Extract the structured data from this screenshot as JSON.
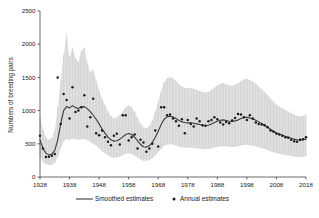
{
  "chart_data": {
    "type": "line",
    "title": "",
    "xlabel": "",
    "ylabel": "Numbers of breeding pairs",
    "xlim": [
      1928,
      2018
    ],
    "ylim": [
      0,
      2500
    ],
    "xticks": [
      1928,
      1938,
      1948,
      1958,
      1968,
      1978,
      1988,
      1998,
      2008,
      2018
    ],
    "yticks": [
      0,
      500,
      1000,
      1500,
      2000,
      2500
    ],
    "grid": false,
    "legend_position": "bottom",
    "legend": [
      {
        "label": "Smoothed estimates",
        "marker": "line",
        "color": "#3a3a3a"
      },
      {
        "label": "Annual estimates",
        "marker": "point",
        "color": "#1c1c1c"
      }
    ],
    "band_color": "#c9c9c9",
    "x": [
      1928,
      1929,
      1930,
      1931,
      1932,
      1933,
      1934,
      1935,
      1936,
      1937,
      1938,
      1939,
      1940,
      1941,
      1942,
      1943,
      1944,
      1945,
      1946,
      1947,
      1948,
      1949,
      1950,
      1951,
      1952,
      1953,
      1954,
      1955,
      1956,
      1957,
      1958,
      1959,
      1960,
      1961,
      1962,
      1963,
      1964,
      1965,
      1966,
      1967,
      1968,
      1969,
      1970,
      1971,
      1972,
      1973,
      1974,
      1975,
      1976,
      1977,
      1978,
      1979,
      1980,
      1981,
      1982,
      1983,
      1984,
      1985,
      1986,
      1987,
      1988,
      1989,
      1990,
      1991,
      1992,
      1993,
      1994,
      1995,
      1996,
      1997,
      1998,
      1999,
      2000,
      2001,
      2002,
      2003,
      2004,
      2005,
      2006,
      2007,
      2008,
      2009,
      2010,
      2011,
      2012,
      2013,
      2014,
      2015,
      2016,
      2017,
      2018
    ],
    "series": [
      {
        "name": "Smoothed estimates",
        "type": "line",
        "values": [
          560,
          430,
          360,
          330,
          345,
          400,
          560,
          800,
          1000,
          1060,
          1040,
          1075,
          1045,
          1035,
          1055,
          1060,
          1030,
          985,
          930,
          870,
          800,
          720,
          660,
          600,
          560,
          540,
          545,
          570,
          605,
          640,
          655,
          640,
          600,
          545,
          490,
          455,
          450,
          470,
          520,
          600,
          690,
          790,
          870,
          905,
          915,
          905,
          880,
          850,
          830,
          820,
          815,
          815,
          810,
          800,
          790,
          780,
          775,
          780,
          800,
          820,
          840,
          855,
          860,
          850,
          840,
          835,
          845,
          860,
          880,
          895,
          900,
          890,
          875,
          855,
          830,
          805,
          780,
          750,
          720,
          690,
          665,
          645,
          630,
          615,
          600,
          585,
          570,
          560,
          555,
          560,
          570
        ]
      },
      {
        "name": "Annual estimates",
        "type": "scatter",
        "values": [
          620,
          430,
          300,
          305,
          320,
          345,
          1500,
          800,
          1250,
          1160,
          880,
          1350,
          980,
          1000,
          1050,
          1230,
          760,
          900,
          1180,
          660,
          630,
          700,
          600,
          530,
          480,
          620,
          650,
          490,
          930,
          930,
          550,
          600,
          640,
          430,
          560,
          520,
          380,
          430,
          500,
          700,
          460,
          1050,
          1050,
          930,
          940,
          880,
          840,
          770,
          870,
          660,
          860,
          800,
          760,
          880,
          840,
          780,
          770,
          840,
          860,
          900,
          870,
          820,
          790,
          830,
          810,
          850,
          890,
          950,
          940,
          900,
          860,
          930,
          880,
          820,
          800,
          790,
          780,
          750,
          700,
          680,
          650,
          640,
          620,
          600,
          590,
          560,
          540,
          530,
          560,
          570,
          600
        ]
      }
    ],
    "ci_lower": [
      300,
      230,
      195,
      180,
      185,
      215,
      300,
      430,
      540,
      570,
      560,
      580,
      565,
      560,
      570,
      572,
      556,
      532,
      502,
      470,
      432,
      389,
      356,
      324,
      302,
      291,
      294,
      308,
      327,
      346,
      354,
      346,
      324,
      294,
      265,
      246,
      243,
      254,
      281,
      324,
      373,
      427,
      470,
      489,
      494,
      489,
      475,
      459,
      448,
      443,
      440,
      440,
      437,
      432,
      427,
      421,
      419,
      421,
      432,
      443,
      454,
      462,
      464,
      459,
      454,
      451,
      456,
      464,
      475,
      483,
      486,
      480,
      472,
      462,
      448,
      435,
      421,
      405,
      389,
      373,
      359,
      348,
      340,
      332,
      324,
      316,
      308,
      302,
      300,
      302,
      308
    ],
    "ci_upper": [
      900,
      720,
      600,
      560,
      590,
      700,
      1050,
      1450,
      1850,
      2150,
      1800,
      1950,
      1790,
      1730,
      1900,
      1950,
      1720,
      1580,
      1620,
      1450,
      1310,
      1180,
      1080,
      985,
      920,
      885,
      895,
      935,
      990,
      1050,
      1075,
      1050,
      985,
      895,
      805,
      747,
      739,
      772,
      854,
      985,
      1133,
      1297,
      1428,
      1486,
      1502,
      1486,
      1445,
      1395,
      1363,
      1346,
      1338,
      1338,
      1330,
      1314,
      1297,
      1281,
      1272,
      1281,
      1314,
      1346,
      1379,
      1404,
      1412,
      1396,
      1379,
      1371,
      1388,
      1412,
      1445,
      1470,
      1478,
      1461,
      1437,
      1404,
      1363,
      1322,
      1281,
      1232,
      1182,
      1133,
      1092,
      1059,
      1034,
      1010,
      985,
      961,
      936,
      920,
      911,
      920,
      936
    ]
  }
}
